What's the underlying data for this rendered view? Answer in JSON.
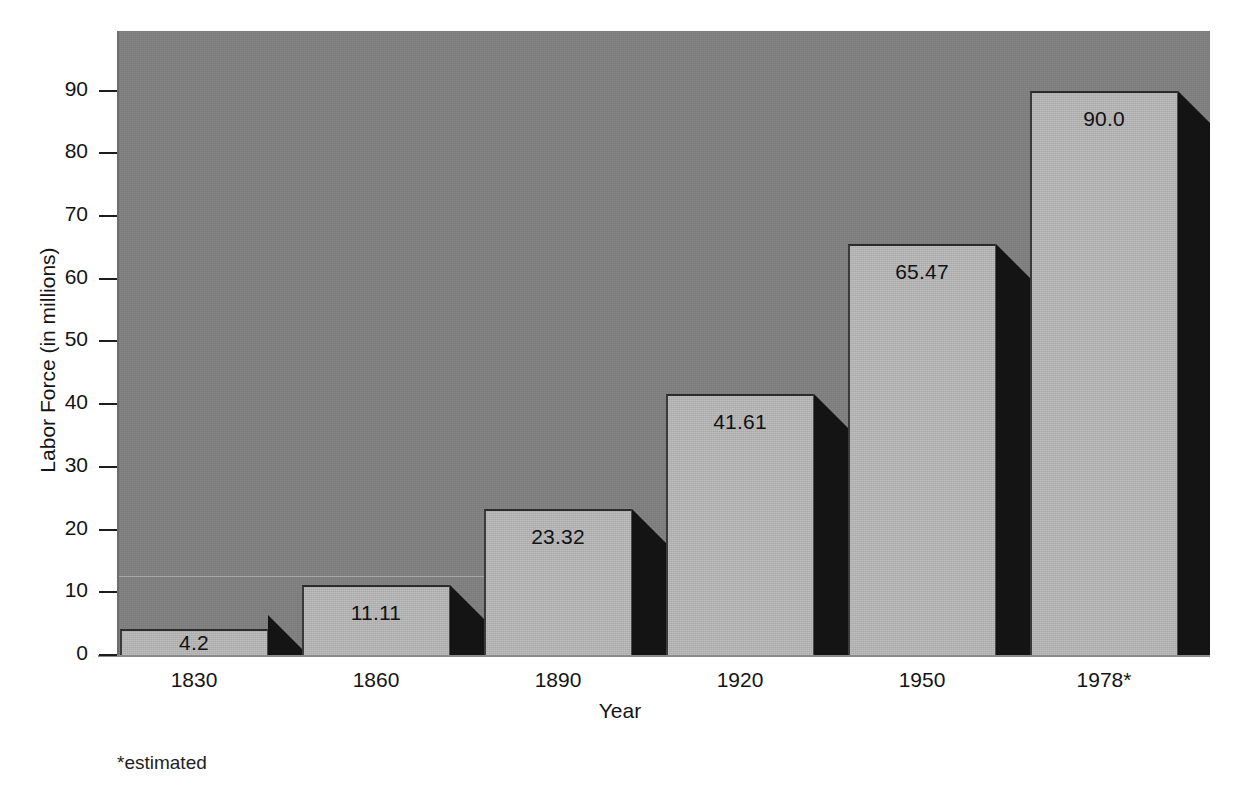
{
  "chart_data": {
    "type": "bar",
    "title": "",
    "subtitle": "",
    "xlabel": "Year",
    "ylabel": "Labor Force (in millions)",
    "categories": [
      "1830",
      "1860",
      "1890",
      "1920",
      "1950",
      "1978*"
    ],
    "values": [
      4.2,
      11.11,
      23.32,
      41.61,
      65.47,
      90.0
    ],
    "value_labels": [
      "4.2",
      "11.11",
      "23.32",
      "41.61",
      "65.47",
      "90.0"
    ],
    "ylim": [
      0,
      99.5
    ],
    "yticks": [
      0,
      10,
      20,
      30,
      40,
      50,
      60,
      70,
      80,
      90
    ],
    "ytick_labels": [
      "0",
      "10",
      "20",
      "30",
      "40",
      "50",
      "60",
      "70",
      "80",
      "90"
    ],
    "grid": false,
    "legend": null,
    "annotations": [
      "*estimated"
    ],
    "style": "3d-bar",
    "colors": {
      "plot_background": "#808080",
      "bar_face": "#b9b9b9",
      "bar_side": "#141414",
      "page_background": "#ffffff",
      "text": "#141414"
    }
  },
  "footnote": "*estimated"
}
